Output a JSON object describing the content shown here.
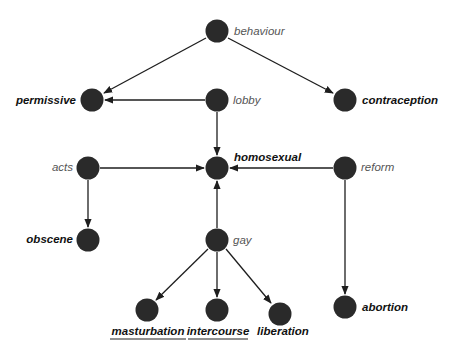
{
  "diagram": {
    "type": "directed-graph",
    "node_color": "#2a2a2a",
    "edge_color": "#1e1e1e",
    "nodes": [
      {
        "id": "behaviour",
        "label": "behaviour",
        "style": "italic",
        "x": 217,
        "y": 31,
        "label_side": "right"
      },
      {
        "id": "permissive",
        "label": "permissive",
        "style": "bold-italic",
        "x": 92,
        "y": 100,
        "label_side": "left"
      },
      {
        "id": "lobby",
        "label": "lobby",
        "style": "italic",
        "x": 217,
        "y": 100,
        "label_side": "right"
      },
      {
        "id": "contraception",
        "label": "contraception",
        "style": "bold-italic",
        "x": 345,
        "y": 100,
        "label_side": "right"
      },
      {
        "id": "acts",
        "label": "acts",
        "style": "italic",
        "x": 88,
        "y": 168,
        "label_side": "left"
      },
      {
        "id": "homosexual",
        "label": "homosexual",
        "style": "bold-italic",
        "x": 217,
        "y": 168,
        "label_side": "top-right"
      },
      {
        "id": "reform",
        "label": "reform",
        "style": "italic",
        "x": 345,
        "y": 168,
        "label_side": "right"
      },
      {
        "id": "obscene",
        "label": "obscene",
        "style": "bold-italic",
        "x": 88,
        "y": 240,
        "label_side": "left"
      },
      {
        "id": "gay",
        "label": "gay",
        "style": "italic",
        "x": 217,
        "y": 240,
        "label_side": "right"
      },
      {
        "id": "masturbation",
        "label": "masturbation",
        "style": "bold-italic-underline",
        "x": 147,
        "y": 310,
        "label_side": "below"
      },
      {
        "id": "intercourse",
        "label": "intercourse",
        "style": "bold-italic-underline",
        "x": 217,
        "y": 310,
        "label_side": "below"
      },
      {
        "id": "liberation",
        "label": "liberation",
        "style": "bold-italic",
        "x": 280,
        "y": 314,
        "label_side": "below"
      },
      {
        "id": "abortion",
        "label": "abortion",
        "style": "bold-italic",
        "x": 345,
        "y": 307,
        "label_side": "right"
      }
    ],
    "edges": [
      {
        "from": "behaviour",
        "to": "permissive"
      },
      {
        "from": "behaviour",
        "to": "contraception"
      },
      {
        "from": "lobby",
        "to": "permissive"
      },
      {
        "from": "lobby",
        "to": "homosexual"
      },
      {
        "from": "acts",
        "to": "homosexual"
      },
      {
        "from": "acts",
        "to": "obscene"
      },
      {
        "from": "reform",
        "to": "homosexual"
      },
      {
        "from": "reform",
        "to": "abortion"
      },
      {
        "from": "gay",
        "to": "homosexual"
      },
      {
        "from": "gay",
        "to": "masturbation"
      },
      {
        "from": "gay",
        "to": "intercourse"
      },
      {
        "from": "gay",
        "to": "liberation"
      }
    ]
  },
  "labels": {
    "behaviour": "behaviour",
    "permissive": "permissive",
    "lobby": "lobby",
    "contraception": "contraception",
    "acts": "acts",
    "homosexual": "homosexual",
    "reform": "reform",
    "obscene": "obscene",
    "gay": "gay",
    "masturbation": "masturbation",
    "intercourse": "intercourse",
    "liberation": "liberation",
    "abortion": "abortion"
  }
}
